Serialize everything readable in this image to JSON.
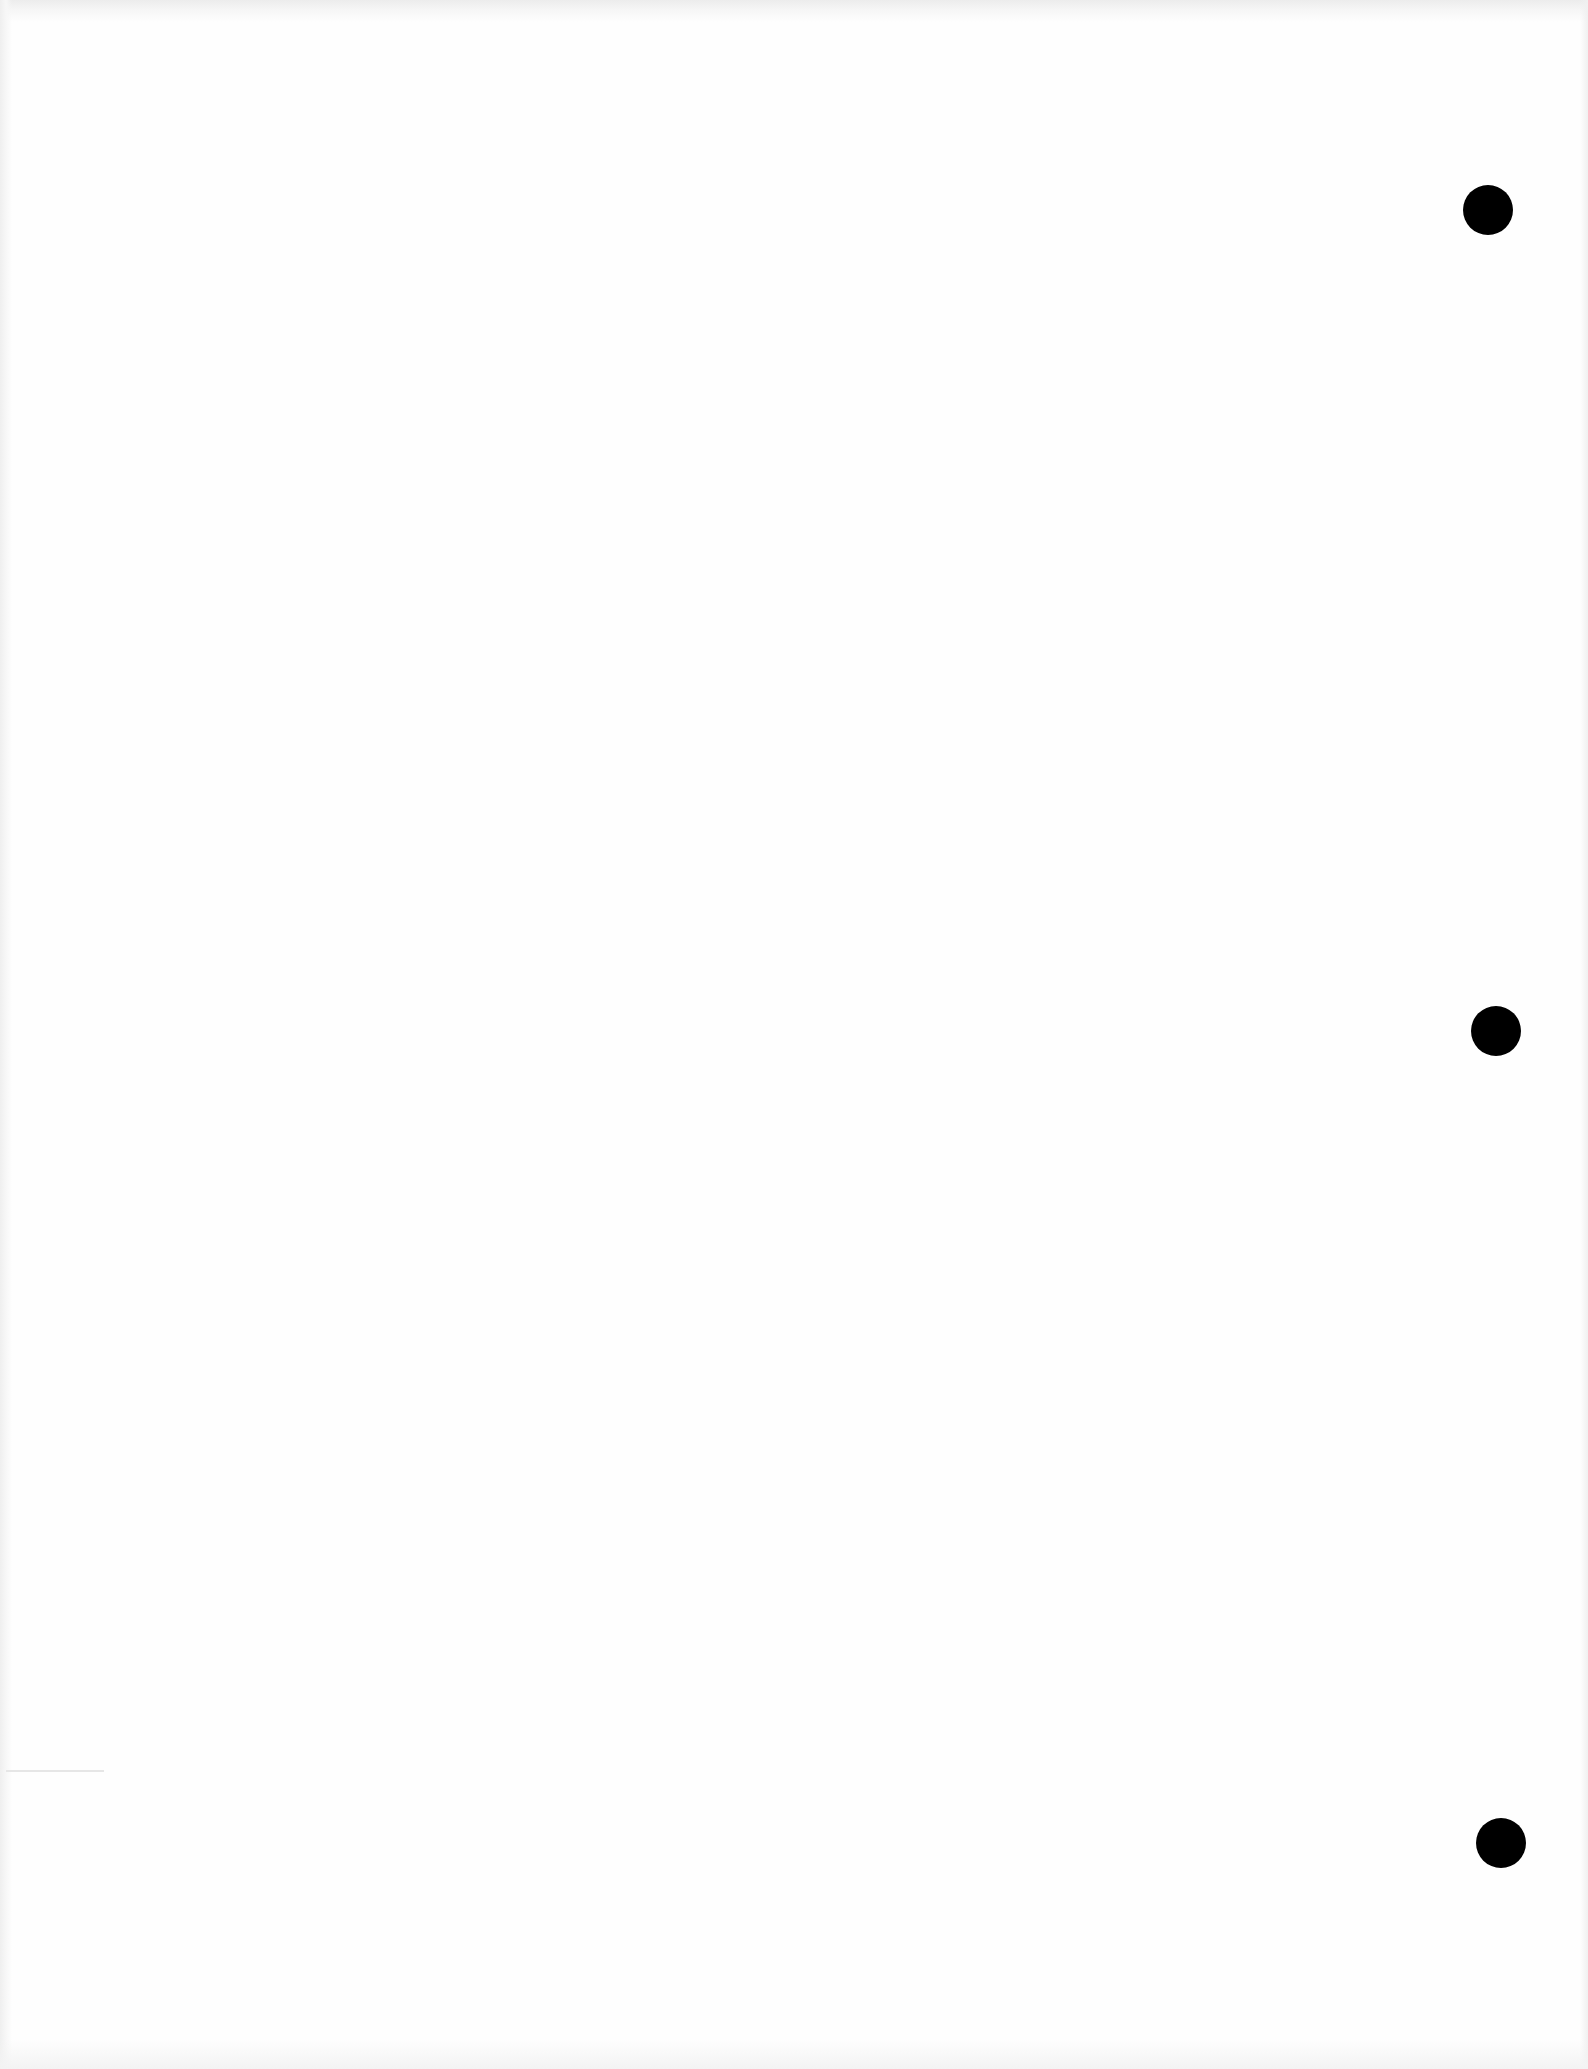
{
  "page": {
    "type": "blank scanned page",
    "background_color": "#fefefe",
    "text_content": ""
  },
  "punch_holes": [
    {
      "position": "top",
      "cx": 1488,
      "cy": 210,
      "diameter": 50,
      "color": "#000000"
    },
    {
      "position": "middle",
      "cx": 1496,
      "cy": 1031,
      "diameter": 50,
      "color": "#000000"
    },
    {
      "position": "bottom",
      "cx": 1501,
      "cy": 1843,
      "diameter": 50,
      "color": "#000000"
    }
  ]
}
